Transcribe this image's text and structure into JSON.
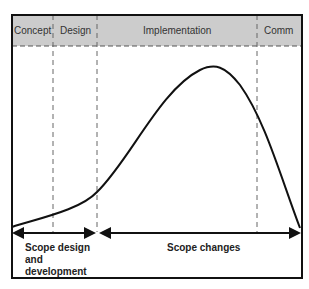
{
  "diagram": {
    "phases": [
      {
        "label": "Concept"
      },
      {
        "label": "Design"
      },
      {
        "label": "Implementation"
      },
      {
        "label": "Comm"
      }
    ],
    "bottom_labels": {
      "left": [
        "Scope design",
        "and",
        "development"
      ],
      "right": "Scope changes"
    },
    "colors": {
      "header_fill": "#cccccc",
      "frame": "#111111",
      "curve": "#111111",
      "dash": "#666666"
    }
  }
}
